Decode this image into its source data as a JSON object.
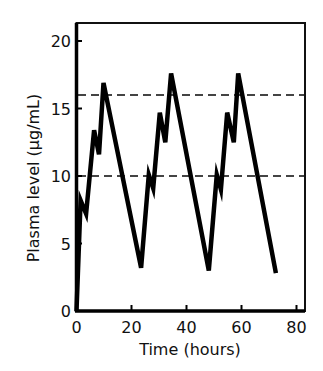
{
  "chart_data": {
    "type": "line",
    "title": "",
    "xlabel": "Time (hours)",
    "ylabel": "Plasma level (µg/mL)",
    "xlim": [
      0,
      83
    ],
    "ylim": [
      0,
      21.3
    ],
    "x_ticks": [
      0,
      20,
      40,
      60,
      80
    ],
    "x_tick_labels": [
      "0",
      "20",
      "40",
      "60",
      "80"
    ],
    "y_ticks": [
      0,
      5,
      10,
      15,
      20
    ],
    "y_tick_labels": [
      "0",
      "5",
      "10",
      "15",
      "20"
    ],
    "grid": false,
    "legend": null,
    "reference_lines": [
      {
        "y": 16,
        "style": "dashed",
        "color": "#444444"
      },
      {
        "y": 10,
        "style": "dashed",
        "color": "#444444"
      }
    ],
    "series": [
      {
        "name": "Plasma level",
        "color": "#000000",
        "x": [
          0,
          1.5,
          3.5,
          6.4,
          8.2,
          9.8,
          23.5,
          26.3,
          27.9,
          30.3,
          32.3,
          34.4,
          48.1,
          51.0,
          52.5,
          54.8,
          57.2,
          58.8,
          72.5
        ],
        "y": [
          0,
          8.2,
          7.2,
          13.4,
          11.6,
          16.9,
          3.2,
          10.1,
          9.1,
          14.7,
          12.5,
          17.6,
          3.0,
          10.1,
          9.0,
          14.7,
          12.5,
          17.6,
          2.8
        ]
      }
    ]
  }
}
